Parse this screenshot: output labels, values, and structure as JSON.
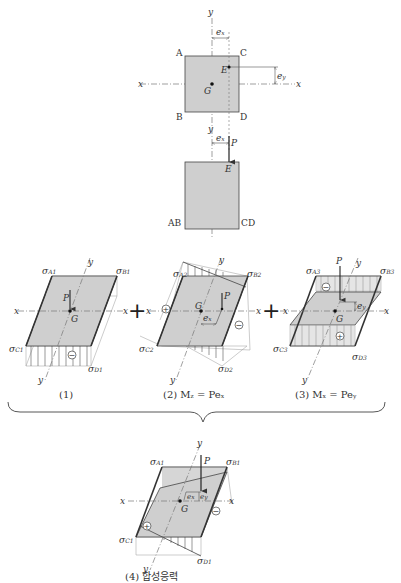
{
  "plan_view": {
    "axis_y_top": "y",
    "axis_y_bottom": "y",
    "axis_x_left": "x",
    "axis_x_right": "x",
    "corner_a": "A",
    "corner_b": "B",
    "corner_c": "C",
    "corner_d": "D",
    "point_e": "E",
    "point_g": "G",
    "dim_ex": "e",
    "dim_ex_sub": "x",
    "dim_ey": "e",
    "dim_ey_sub": "y"
  },
  "elevation_view": {
    "dim_ex": "e",
    "dim_ex_sub": "x",
    "load": "P",
    "point_e": "E",
    "left_label": "AB",
    "right_label": "CD"
  },
  "panels": [
    {
      "caption": "(1)",
      "sigma_a": "σ",
      "sigma_a_sub": "A1",
      "sigma_b": "σ",
      "sigma_b_sub": "B1",
      "sigma_c": "σ",
      "sigma_c_sub": "C1",
      "sigma_d": "σ",
      "sigma_d_sub": "D1",
      "load": "P",
      "centroid": "G",
      "axis_x": "x",
      "axis_y": "y",
      "sign": "−"
    },
    {
      "caption": "(2) M",
      "caption_sub": "z",
      "caption_eq": " = Pe",
      "caption_eq_sub": "x",
      "sigma_a": "σ",
      "sigma_a_sub": "A2",
      "sigma_b": "σ",
      "sigma_b_sub": "B2",
      "sigma_c": "σ",
      "sigma_c_sub": "C2",
      "sigma_d": "σ",
      "sigma_d_sub": "D2",
      "load": "P",
      "centroid": "G",
      "axis_x": "x",
      "axis_y": "y",
      "dim": "e",
      "dim_sub": "x",
      "sign_left": "+",
      "sign_right": "−"
    },
    {
      "caption": "(3) M",
      "caption_sub": "x",
      "caption_eq": " = Pe",
      "caption_eq_sub": "y",
      "sigma_a": "σ",
      "sigma_a_sub": "A3",
      "sigma_b": "σ",
      "sigma_b_sub": "B3",
      "sigma_c": "σ",
      "sigma_c_sub": "C3",
      "sigma_d": "σ",
      "sigma_d_sub": "D3",
      "load": "P",
      "centroid": "G",
      "axis_x": "x",
      "axis_y": "y",
      "dim": "e",
      "dim_sub": "y",
      "sign_back": "−",
      "sign_front": "+"
    },
    {
      "caption": "(4) 합성응력",
      "sigma_a": "σ",
      "sigma_a_sub": "A1",
      "sigma_b": "σ",
      "sigma_b_sub": "B1",
      "sigma_c": "σ",
      "sigma_c_sub": "C1",
      "sigma_d": "σ",
      "sigma_d_sub": "D1",
      "load": "P",
      "centroid": "G",
      "axis_x": "x",
      "axis_y": "y",
      "dim_x": "e",
      "dim_x_sub": "x",
      "dim_y": "e",
      "dim_y_sub": "y",
      "sign_left": "+",
      "sign_right": "−"
    }
  ],
  "operators": {
    "plus": "+"
  }
}
